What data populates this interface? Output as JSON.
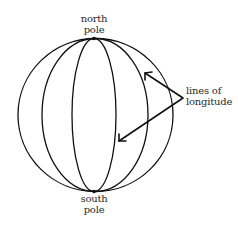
{
  "diagram": {
    "type": "globe-longitude",
    "labels": {
      "north_pole": [
        "north",
        "pole"
      ],
      "south_pole": [
        "south",
        "pole"
      ],
      "longitude": [
        "lines of",
        "longitude"
      ]
    },
    "colors": {
      "stroke": "#111111",
      "text": "#2a2a2a",
      "background": "#ffffff"
    }
  }
}
